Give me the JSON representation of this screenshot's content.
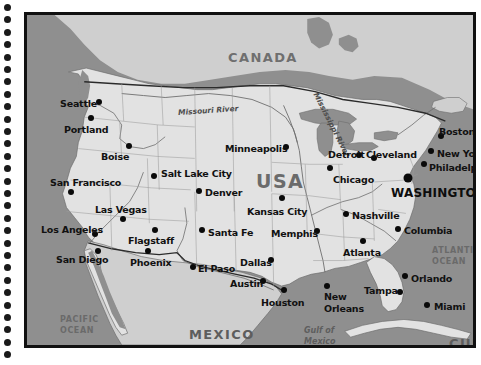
{
  "page": {
    "background_color": "#ffffff"
  },
  "binding": {
    "name": "spiral-notebook-holes",
    "hole_count": 29,
    "color": "#1a1a1a"
  },
  "map": {
    "frame_color": "#111111",
    "colors": {
      "land_usa": "#e2e2e2",
      "land_neighbor": "#cfcfcf",
      "water": "#8f8f8f",
      "border_line": "#5a5a5a",
      "dot": "#0a0a0a"
    },
    "countries": [
      {
        "name": "CANADA",
        "label": "CANADA",
        "x": 201,
        "y": 36,
        "style": "country"
      },
      {
        "name": "USA",
        "label": "USA",
        "x": 229,
        "y": 157,
        "style": "usa"
      },
      {
        "name": "MEXICO",
        "label": "MEXICO",
        "x": 162,
        "y": 313,
        "style": "country-dark"
      },
      {
        "name": "CUBA",
        "label": "CUBA",
        "x": 422,
        "y": 322,
        "style": "country-dark"
      }
    ],
    "oceans": [
      {
        "name": "PACIFIC OCEAN",
        "line1": "PACIFIC",
        "line2": "OCEAN",
        "x": 33,
        "y": 300
      },
      {
        "name": "ATLANTIC OCEAN",
        "line1": "ATLANTIC",
        "line2": "OCEAN",
        "x": 405,
        "y": 231
      }
    ],
    "gulfs": [
      {
        "name": "Gulf of Mexico",
        "line1": "Gulf of",
        "line2": "Mexico",
        "x": 277,
        "y": 311
      }
    ],
    "rivers": [
      {
        "name": "Missouri River",
        "label": "Missouri River",
        "x": 151,
        "y": 92,
        "rotate": -4
      },
      {
        "name": "Mississippi River",
        "label": "Mississippi River",
        "x": 269,
        "y": 106,
        "rotate": 63
      }
    ],
    "cities": [
      {
        "name": "Seattle",
        "label": "Seattle",
        "dot_x": 72,
        "dot_y": 87,
        "label_x": 33,
        "label_y": 84,
        "size": "normal"
      },
      {
        "name": "Portland",
        "label": "Portland",
        "dot_x": 64,
        "dot_y": 103,
        "label_x": 37,
        "label_y": 110,
        "size": "normal"
      },
      {
        "name": "Boise",
        "label": "Boise",
        "dot_x": 102,
        "dot_y": 131,
        "label_x": 74,
        "label_y": 137,
        "size": "normal"
      },
      {
        "name": "San Francisco",
        "label": "San Francisco",
        "dot_x": 44,
        "dot_y": 177,
        "label_x": 23,
        "label_y": 163,
        "size": "normal"
      },
      {
        "name": "Salt Lake City",
        "label": "Salt Lake City",
        "dot_x": 127,
        "dot_y": 161,
        "label_x": 134,
        "label_y": 154,
        "size": "normal"
      },
      {
        "name": "Denver",
        "label": "Denver",
        "dot_x": 172,
        "dot_y": 176,
        "label_x": 178,
        "label_y": 173,
        "size": "normal"
      },
      {
        "name": "Las Vegas",
        "label": "Las Vegas",
        "dot_x": 96,
        "dot_y": 204,
        "label_x": 68,
        "label_y": 190,
        "size": "normal"
      },
      {
        "name": "Los Angeles",
        "label": "Los Angeles",
        "dot_x": 68,
        "dot_y": 219,
        "label_x": 14,
        "label_y": 210,
        "size": "normal"
      },
      {
        "name": "San Diego",
        "label": "San Diego",
        "dot_x": 71,
        "dot_y": 236,
        "label_x": 29,
        "label_y": 240,
        "size": "normal"
      },
      {
        "name": "Flagstaff",
        "label": "Flagstaff",
        "dot_x": 128,
        "dot_y": 215,
        "label_x": 101,
        "label_y": 221,
        "size": "normal"
      },
      {
        "name": "Phoenix",
        "label": "Phoenix",
        "dot_x": 121,
        "dot_y": 236,
        "label_x": 103,
        "label_y": 243,
        "size": "normal"
      },
      {
        "name": "Santa Fe",
        "label": "Santa Fe",
        "dot_x": 175,
        "dot_y": 215,
        "label_x": 181,
        "label_y": 213,
        "size": "normal"
      },
      {
        "name": "El Paso",
        "label": "El Paso",
        "dot_x": 166,
        "dot_y": 252,
        "label_x": 171,
        "label_y": 249,
        "size": "normal"
      },
      {
        "name": "Dallas",
        "label": "Dallas",
        "dot_x": 244,
        "dot_y": 245,
        "label_x": 213,
        "label_y": 243,
        "size": "normal"
      },
      {
        "name": "Austin",
        "label": "Austin",
        "dot_x": 236,
        "dot_y": 266,
        "label_x": 203,
        "label_y": 264,
        "size": "normal"
      },
      {
        "name": "Houston",
        "label": "Houston",
        "dot_x": 257,
        "dot_y": 275,
        "label_x": 234,
        "label_y": 283,
        "size": "normal"
      },
      {
        "name": "Minneapolis",
        "label": "Minneapolis",
        "dot_x": 259,
        "dot_y": 132,
        "label_x": 198,
        "label_y": 129,
        "size": "normal"
      },
      {
        "name": "Kansas City",
        "label": "Kansas City",
        "dot_x": 255,
        "dot_y": 183,
        "label_x": 220,
        "label_y": 192,
        "size": "normal"
      },
      {
        "name": "Memphis",
        "label": "Memphis",
        "dot_x": 290,
        "dot_y": 216,
        "label_x": 244,
        "label_y": 214,
        "size": "normal"
      },
      {
        "name": "Chicago",
        "label": "Chicago",
        "dot_x": 303,
        "dot_y": 153,
        "label_x": 306,
        "label_y": 160,
        "size": "normal"
      },
      {
        "name": "Detroit",
        "label": "Detroit",
        "dot_x": 332,
        "dot_y": 140,
        "label_x": 301,
        "label_y": 135,
        "size": "normal"
      },
      {
        "name": "Cleveland",
        "label": "Cleveland",
        "dot_x": 347,
        "dot_y": 143,
        "label_x": 339,
        "label_y": 135,
        "size": "normal"
      },
      {
        "name": "Nashville",
        "label": "Nashville",
        "dot_x": 319,
        "dot_y": 199,
        "label_x": 325,
        "label_y": 196,
        "size": "normal"
      },
      {
        "name": "Atlanta",
        "label": "Atlanta",
        "dot_x": 336,
        "dot_y": 226,
        "label_x": 316,
        "label_y": 233,
        "size": "normal"
      },
      {
        "name": "Columbia",
        "label": "Columbia",
        "dot_x": 371,
        "dot_y": 214,
        "label_x": 377,
        "label_y": 211,
        "size": "normal"
      },
      {
        "name": "New Orleans",
        "label": "New",
        "label2": "Orleans",
        "dot_x": 300,
        "dot_y": 271,
        "label_x": 297,
        "label_y": 277,
        "size": "normal"
      },
      {
        "name": "Tampa",
        "label": "Tampa",
        "dot_x": 373,
        "dot_y": 277,
        "label_x": 337,
        "label_y": 271,
        "size": "normal"
      },
      {
        "name": "Orlando",
        "label": "Orlando",
        "dot_x": 378,
        "dot_y": 261,
        "label_x": 384,
        "label_y": 259,
        "size": "normal"
      },
      {
        "name": "Miami",
        "label": "Miami",
        "dot_x": 400,
        "dot_y": 290,
        "label_x": 407,
        "label_y": 287,
        "size": "normal"
      },
      {
        "name": "Boston",
        "label": "Boston",
        "dot_x": 414,
        "dot_y": 121,
        "label_x": 412,
        "label_y": 112,
        "size": "normal"
      },
      {
        "name": "New York",
        "label": "New York",
        "dot_x": 404,
        "dot_y": 136,
        "label_x": 410,
        "label_y": 134,
        "size": "normal"
      },
      {
        "name": "Philadelphia",
        "label": "Philadelphia",
        "dot_x": 397,
        "dot_y": 149,
        "label_x": 402,
        "label_y": 148,
        "size": "normal"
      },
      {
        "name": "WASHINGTON",
        "label": "WASHINGTON",
        "dot_x": 381,
        "dot_y": 163,
        "label_x": 364,
        "label_y": 172,
        "size": "big",
        "style": "capital"
      }
    ]
  }
}
